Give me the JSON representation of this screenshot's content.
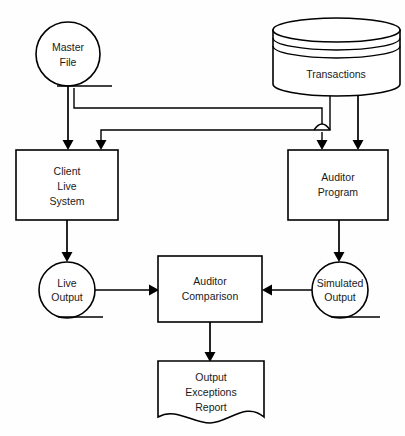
{
  "diagram": {
    "background_color": "#fefefe",
    "line_color": "#000000",
    "text_color": "#1a1a1a",
    "nodes": {
      "master_file": {
        "label_line1": "Master",
        "label_line2": "File",
        "shape": "magnetic-tape"
      },
      "transactions": {
        "label": "Transactions",
        "shape": "database-cylinder"
      },
      "client_live_system": {
        "label_line1": "Client",
        "label_line2": "Live",
        "label_line3": "System",
        "shape": "process-box"
      },
      "auditor_program": {
        "label_line1": "Auditor",
        "label_line2": "Program",
        "shape": "process-box"
      },
      "live_output": {
        "label_line1": "Live",
        "label_line2": "Output",
        "shape": "magnetic-tape"
      },
      "simulated_output": {
        "label_line1": "Simulated",
        "label_line2": "Output",
        "shape": "magnetic-tape"
      },
      "auditor_comparison": {
        "label_line1": "Auditor",
        "label_line2": "Comparison",
        "shape": "process-box"
      },
      "output_exceptions_report": {
        "label_line1": "Output",
        "label_line2": "Exceptions",
        "label_line3": "Report",
        "shape": "document"
      }
    }
  }
}
